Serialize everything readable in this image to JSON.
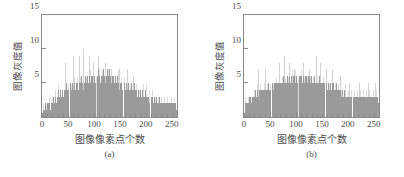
{
  "figure": {
    "background": "#ffffff",
    "bar_color": "#9a9a9a",
    "bar_light_color": "#d2d2d2",
    "axis_color": "#8a8a8a",
    "text_color": "#4a4a4a"
  },
  "panels": [
    {
      "id": "a",
      "caption": "(a)",
      "xlabel": "图像像素点个数",
      "ylabel": "图像灰度值"
    },
    {
      "id": "b",
      "caption": "(b)",
      "xlabel": "图像像素点个数",
      "ylabel": "图像灰度值"
    }
  ],
  "chart_data": [
    {
      "type": "bar",
      "title": "",
      "subtitle": "(a)",
      "xlabel": "图像像素点个数",
      "ylabel": "图像灰度值",
      "xlim": [
        0,
        260
      ],
      "ylim": [
        0,
        15
      ],
      "xticks": [
        0,
        50,
        100,
        150,
        200,
        250
      ],
      "yticks": [
        0,
        5,
        10,
        15
      ],
      "xticklabels": [
        "0",
        "50",
        "100",
        "150",
        "200",
        "250"
      ],
      "yticklabels": [
        "0",
        "5",
        "10",
        "15"
      ],
      "grid": false,
      "legend": null,
      "x": [
        1,
        3,
        5,
        7,
        9,
        11,
        13,
        15,
        17,
        19,
        21,
        23,
        25,
        27,
        29,
        31,
        33,
        35,
        37,
        39,
        41,
        43,
        45,
        47,
        49,
        51,
        53,
        55,
        57,
        59,
        61,
        63,
        65,
        67,
        69,
        71,
        73,
        75,
        77,
        79,
        81,
        83,
        85,
        87,
        89,
        91,
        93,
        95,
        97,
        99,
        101,
        103,
        105,
        107,
        109,
        111,
        113,
        115,
        117,
        119,
        121,
        123,
        125,
        127,
        129,
        131,
        133,
        135,
        137,
        139,
        141,
        143,
        145,
        147,
        149,
        151,
        153,
        155,
        157,
        159,
        161,
        163,
        165,
        167,
        169,
        171,
        173,
        175,
        177,
        179,
        181,
        183,
        185,
        187,
        189,
        191,
        193,
        195,
        197,
        199,
        201,
        203,
        205,
        207,
        209,
        211,
        213,
        215,
        217,
        219,
        221,
        223,
        225,
        227,
        229,
        231,
        233,
        235,
        237,
        239,
        241,
        243,
        245,
        247,
        249,
        251,
        253,
        255,
        257,
        259
      ],
      "values": [
        1,
        1,
        2,
        1,
        2,
        2,
        2,
        1,
        2,
        2,
        3,
        2,
        3,
        2,
        3,
        4,
        3,
        4,
        3,
        4,
        3,
        4,
        4,
        5,
        4,
        4,
        5,
        4,
        5,
        4,
        5,
        4,
        5,
        5,
        4,
        5,
        5,
        6,
        5,
        4,
        5,
        6,
        5,
        6,
        5,
        6,
        5,
        6,
        6,
        5,
        6,
        5,
        6,
        7,
        6,
        5,
        6,
        6,
        7,
        6,
        5,
        6,
        7,
        6,
        7,
        6,
        5,
        6,
        6,
        5,
        6,
        5,
        6,
        5,
        4,
        5,
        5,
        4,
        5,
        4,
        5,
        4,
        5,
        4,
        4,
        5,
        4,
        4,
        5,
        4,
        4,
        3,
        4,
        3,
        4,
        3,
        4,
        3,
        3,
        4,
        3,
        3,
        3,
        2,
        3,
        3,
        2,
        3,
        2,
        3,
        2,
        2,
        3,
        2,
        2,
        2,
        2,
        2,
        2,
        2,
        2,
        2,
        2,
        2,
        2,
        2,
        2,
        2,
        2,
        1
      ],
      "spikes": [
        {
          "x": 45,
          "value": 8
        },
        {
          "x": 59,
          "value": 9
        },
        {
          "x": 71,
          "value": 9
        },
        {
          "x": 79,
          "value": 10
        },
        {
          "x": 91,
          "value": 9
        },
        {
          "x": 99,
          "value": 8
        },
        {
          "x": 107,
          "value": 9
        },
        {
          "x": 121,
          "value": 8
        },
        {
          "x": 133,
          "value": 7
        },
        {
          "x": 149,
          "value": 7
        },
        {
          "x": 163,
          "value": 7
        },
        {
          "x": 175,
          "value": 6
        }
      ]
    },
    {
      "type": "bar",
      "title": "",
      "subtitle": "(b)",
      "xlabel": "图像像素点个数",
      "ylabel": "图像灰度值",
      "xlim": [
        0,
        260
      ],
      "ylim": [
        0,
        15
      ],
      "xticks": [
        0,
        50,
        100,
        150,
        200,
        250
      ],
      "yticks": [
        0,
        5,
        10,
        15
      ],
      "xticklabels": [
        "0",
        "50",
        "100",
        "150",
        "200",
        "250"
      ],
      "yticklabels": [
        "0",
        "5",
        "10",
        "15"
      ],
      "grid": false,
      "legend": null,
      "x": [
        1,
        3,
        5,
        7,
        9,
        11,
        13,
        15,
        17,
        19,
        21,
        23,
        25,
        27,
        29,
        31,
        33,
        35,
        37,
        39,
        41,
        43,
        45,
        47,
        49,
        51,
        53,
        55,
        57,
        59,
        61,
        63,
        65,
        67,
        69,
        71,
        73,
        75,
        77,
        79,
        81,
        83,
        85,
        87,
        89,
        91,
        93,
        95,
        97,
        99,
        101,
        103,
        105,
        107,
        109,
        111,
        113,
        115,
        117,
        119,
        121,
        123,
        125,
        127,
        129,
        131,
        133,
        135,
        137,
        139,
        141,
        143,
        145,
        147,
        149,
        151,
        153,
        155,
        157,
        159,
        161,
        163,
        165,
        167,
        169,
        171,
        173,
        175,
        177,
        179,
        181,
        183,
        185,
        187,
        189,
        191,
        193,
        195,
        197,
        199,
        201,
        203,
        205,
        207,
        209,
        211,
        213,
        215,
        217,
        219,
        221,
        223,
        225,
        227,
        229,
        231,
        233,
        235,
        237,
        239,
        241,
        243,
        245,
        247,
        249,
        251,
        253,
        255,
        257,
        259
      ],
      "values": [
        2,
        2,
        2,
        2,
        3,
        3,
        2,
        3,
        3,
        3,
        4,
        3,
        4,
        3,
        4,
        4,
        4,
        4,
        4,
        4,
        4,
        4,
        4,
        5,
        4,
        4,
        5,
        4,
        5,
        5,
        5,
        5,
        5,
        5,
        5,
        5,
        5,
        6,
        5,
        5,
        5,
        6,
        5,
        6,
        5,
        6,
        5,
        6,
        6,
        5,
        6,
        5,
        6,
        6,
        6,
        5,
        6,
        5,
        6,
        6,
        5,
        6,
        6,
        5,
        6,
        5,
        5,
        6,
        5,
        5,
        5,
        5,
        6,
        5,
        5,
        5,
        5,
        5,
        5,
        4,
        5,
        4,
        5,
        4,
        5,
        5,
        4,
        4,
        5,
        4,
        4,
        4,
        4,
        3,
        4,
        3,
        4,
        3,
        3,
        3,
        3,
        3,
        3,
        3,
        3,
        3,
        3,
        3,
        3,
        3,
        3,
        3,
        3,
        3,
        3,
        3,
        3,
        3,
        3,
        3,
        3,
        3,
        3,
        3,
        3,
        3,
        3,
        3,
        3,
        2
      ],
      "spikes": [
        {
          "x": 27,
          "value": 7
        },
        {
          "x": 41,
          "value": 7
        },
        {
          "x": 67,
          "value": 8
        },
        {
          "x": 77,
          "value": 9
        },
        {
          "x": 87,
          "value": 8
        },
        {
          "x": 97,
          "value": 7
        },
        {
          "x": 113,
          "value": 8
        },
        {
          "x": 125,
          "value": 7
        },
        {
          "x": 139,
          "value": 9
        },
        {
          "x": 147,
          "value": 8
        },
        {
          "x": 157,
          "value": 7
        },
        {
          "x": 169,
          "value": 7
        },
        {
          "x": 185,
          "value": 6
        },
        {
          "x": 203,
          "value": 5
        },
        {
          "x": 221,
          "value": 5
        },
        {
          "x": 239,
          "value": 5
        },
        {
          "x": 253,
          "value": 5
        }
      ]
    }
  ]
}
